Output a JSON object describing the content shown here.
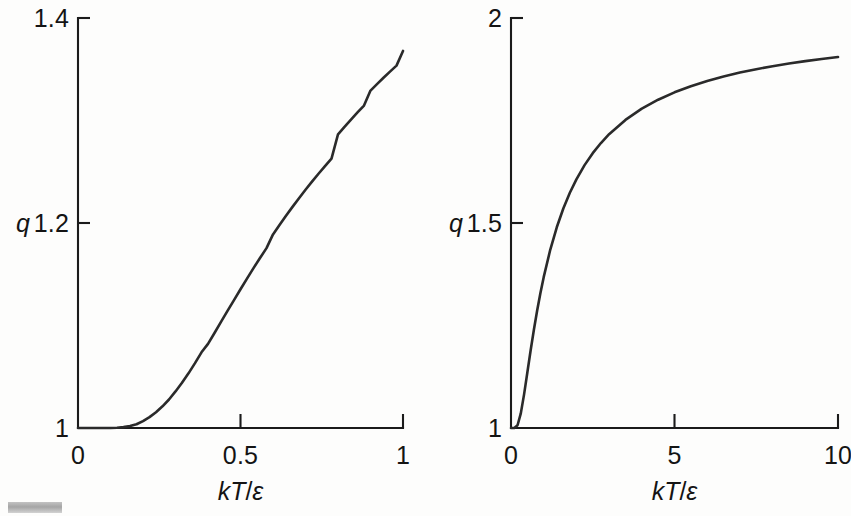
{
  "figure": {
    "background_color": "#fdfdfc",
    "curve_color": "#2a2a2a",
    "axis_color": "#1b1b1b",
    "corner_mark_color": "#b0b0b0"
  },
  "panels": [
    {
      "id": "left",
      "ylabel": "q",
      "xlabel_num": "kT",
      "xlabel_den": "ε",
      "xlabel_slash": "/",
      "y_ticks": [
        "1",
        "1.2",
        "1.4"
      ],
      "x_ticks": [
        "0",
        "0.5",
        "1"
      ]
    },
    {
      "id": "right",
      "ylabel": "q",
      "xlabel_num": "kT",
      "xlabel_den": "ε",
      "xlabel_slash": "/",
      "y_ticks": [
        "1",
        "1.5",
        "2"
      ],
      "x_ticks": [
        "0",
        "5",
        "10"
      ]
    }
  ],
  "chart_data": [
    {
      "type": "line",
      "title": "",
      "subtitle": "",
      "xlabel": "kT/ε",
      "ylabel": "q",
      "xlim": [
        0,
        1
      ],
      "ylim": [
        1,
        1.4
      ],
      "xticks": [
        0,
        0.5,
        1
      ],
      "xticklabels": [
        "0",
        "0.5",
        "1"
      ],
      "yticks": [
        1,
        1.2,
        1.4
      ],
      "yticklabels": [
        "1",
        "1.2",
        "1.4"
      ],
      "grid": false,
      "legend": null,
      "annotations": [],
      "series": [
        {
          "name": "q = 1 + exp(-ε/kT)",
          "x": [
            0.0,
            0.02,
            0.04,
            0.06,
            0.08,
            0.1,
            0.12,
            0.14,
            0.16,
            0.18,
            0.2,
            0.22,
            0.24,
            0.26,
            0.28,
            0.3,
            0.32,
            0.34,
            0.36,
            0.38,
            0.4,
            0.42,
            0.44,
            0.46,
            0.48,
            0.5,
            0.52,
            0.54,
            0.56,
            0.58,
            0.6,
            0.62,
            0.64,
            0.66,
            0.68,
            0.7,
            0.72,
            0.74,
            0.76,
            0.78,
            0.8,
            0.82,
            0.84,
            0.86,
            0.88,
            0.9,
            0.92,
            0.94,
            0.96,
            0.98,
            1.0
          ],
          "y": [
            1.0,
            1.0,
            1.0,
            1.0,
            1.0,
            1.0,
            1.00024,
            1.00084,
            1.00193,
            1.00364,
            1.00674,
            1.01064,
            1.01543,
            1.02118,
            1.02782,
            1.03567,
            1.04408,
            1.05333,
            1.06326,
            1.07383,
            1.08208,
            1.09271,
            1.10347,
            1.11433,
            1.12471,
            1.13534,
            1.14575,
            1.15592,
            1.16583,
            1.17547,
            1.18888,
            1.19809,
            1.20704,
            1.21573,
            1.22417,
            1.23237,
            1.24032,
            1.24804,
            1.25553,
            1.2628,
            1.2865,
            1.29383,
            1.30096,
            1.30788,
            1.31461,
            1.32919,
            1.33554,
            1.34171,
            1.34772,
            1.35356,
            1.36788
          ]
        }
      ]
    },
    {
      "type": "line",
      "title": "",
      "subtitle": "",
      "xlabel": "kT/ε",
      "ylabel": "q",
      "xlim": [
        0,
        10
      ],
      "ylim": [
        1,
        2
      ],
      "xticks": [
        0,
        5,
        10
      ],
      "xticklabels": [
        "0",
        "5",
        "10"
      ],
      "yticks": [
        1,
        1.5,
        2
      ],
      "yticklabels": [
        "1",
        "1.5",
        "2"
      ],
      "grid": false,
      "legend": null,
      "annotations": [],
      "series": [
        {
          "name": "q = 1 + exp(-ε/kT)",
          "x": [
            0.0,
            0.1,
            0.2,
            0.3,
            0.4,
            0.5,
            0.6,
            0.7,
            0.8,
            0.9,
            1.0,
            1.2,
            1.4,
            1.6,
            1.8,
            2.0,
            2.25,
            2.5,
            2.75,
            3.0,
            3.5,
            4.0,
            4.5,
            5.0,
            5.5,
            6.0,
            6.5,
            7.0,
            7.5,
            8.0,
            8.5,
            9.0,
            9.5,
            10.0
          ],
          "y": [
            1.0,
            1.00005,
            1.00674,
            1.03567,
            1.08208,
            1.13534,
            1.18888,
            1.23965,
            1.2865,
            1.32919,
            1.36788,
            1.4346,
            1.48954,
            1.53526,
            1.57375,
            1.60653,
            1.64118,
            1.67032,
            1.69508,
            1.71653,
            1.75147,
            1.7788,
            1.80074,
            1.81873,
            1.83373,
            1.84648,
            1.85743,
            1.86688,
            1.87517,
            1.8825,
            1.88901,
            1.89484,
            1.9001,
            1.90484
          ]
        }
      ]
    }
  ]
}
